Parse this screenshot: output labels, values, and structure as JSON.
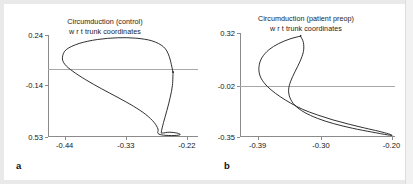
{
  "figure": {
    "background": "#ffffff",
    "axis_color": "#8b8b8b",
    "curve_color": "#1a1a1a",
    "zeroline_color": "#a8a8a8"
  },
  "panels": [
    {
      "letter": "a",
      "title_line1": "Circumduction (control)",
      "title_line2": "w r t trunk  coordinates",
      "yticks": [
        "0.24",
        "-0.14",
        "0.53"
      ],
      "xticks": [
        "-0.44",
        "-0.33",
        "-0.22"
      ]
    },
    {
      "letter": "b",
      "title_line1": "Circumduction (patient preop)",
      "title_line2": "w r t trunk  coordinates",
      "yticks": [
        "0.32",
        "-0.02",
        "-0.35"
      ],
      "xticks": [
        "-0.39",
        "-0.30",
        "-0.20"
      ]
    }
  ],
  "chart_data": [
    {
      "type": "line",
      "title": "Circumduction (control) w r t trunk coordinates",
      "subtitle": "w r t trunk  coordinates",
      "xlabel": "",
      "ylabel": "",
      "grid": false,
      "legend": "none",
      "xlim": [
        -0.47,
        -0.2
      ],
      "ylim": [
        -0.53,
        0.24
      ],
      "xticks": [
        -0.44,
        -0.33,
        -0.22
      ],
      "xticklabels": [
        "-0.44",
        "-0.33",
        "-0.22"
      ],
      "yticks": [
        0.24,
        -0.14,
        -0.53
      ],
      "yticklabels": [
        "0.24",
        "-0.14",
        "0.53"
      ],
      "reference_line_y": -0.02,
      "series": [
        {
          "name": "circumduction-path-control",
          "closed": true,
          "points": [
            [
              -0.245,
              -0.04
            ],
            [
              -0.252,
              0.08
            ],
            [
              -0.262,
              0.15
            ],
            [
              -0.283,
              0.196
            ],
            [
              -0.312,
              0.216
            ],
            [
              -0.345,
              0.219
            ],
            [
              -0.381,
              0.206
            ],
            [
              -0.414,
              0.176
            ],
            [
              -0.437,
              0.13
            ],
            [
              -0.444,
              0.072
            ],
            [
              -0.44,
              0.02
            ],
            [
              -0.425,
              -0.035
            ],
            [
              -0.402,
              -0.098
            ],
            [
              -0.374,
              -0.165
            ],
            [
              -0.344,
              -0.232
            ],
            [
              -0.316,
              -0.298
            ],
            [
              -0.294,
              -0.36
            ],
            [
              -0.279,
              -0.42
            ],
            [
              -0.272,
              -0.47
            ],
            [
              -0.272,
              -0.503
            ],
            [
              -0.262,
              -0.516
            ],
            [
              -0.243,
              -0.519
            ],
            [
              -0.232,
              -0.512
            ],
            [
              -0.238,
              -0.5
            ],
            [
              -0.252,
              -0.494
            ],
            [
              -0.264,
              -0.5
            ],
            [
              -0.266,
              -0.492
            ],
            [
              -0.262,
              -0.42
            ],
            [
              -0.256,
              -0.33
            ],
            [
              -0.25,
              -0.23
            ],
            [
              -0.246,
              -0.14
            ],
            [
              -0.245,
              -0.04
            ]
          ]
        }
      ]
    },
    {
      "type": "line",
      "title": "Circumduction (patient preop) w r t trunk coordinates",
      "subtitle": "w r t trunk  coordinates",
      "xlabel": "",
      "ylabel": "",
      "grid": false,
      "legend": "none",
      "xlim": [
        -0.415,
        -0.195
      ],
      "ylim": [
        -0.35,
        0.32
      ],
      "xticks": [
        -0.39,
        -0.3,
        -0.2
      ],
      "xticklabels": [
        "-0.39",
        "-0.30",
        "-0.20"
      ],
      "yticks": [
        0.32,
        -0.02,
        -0.35
      ],
      "yticklabels": [
        "0.32",
        "-0.02",
        "-0.35"
      ],
      "reference_line_y": -0.02,
      "series": [
        {
          "name": "circumduction-path-patient-preop",
          "closed": true,
          "points": [
            [
              -0.329,
              0.3
            ],
            [
              -0.344,
              0.282
            ],
            [
              -0.36,
              0.252
            ],
            [
              -0.374,
              0.212
            ],
            [
              -0.384,
              0.16
            ],
            [
              -0.388,
              0.105
            ],
            [
              -0.387,
              0.05
            ],
            [
              -0.381,
              0.0
            ],
            [
              -0.371,
              -0.046
            ],
            [
              -0.358,
              -0.09
            ],
            [
              -0.343,
              -0.132
            ],
            [
              -0.326,
              -0.172
            ],
            [
              -0.305,
              -0.208
            ],
            [
              -0.283,
              -0.24
            ],
            [
              -0.26,
              -0.268
            ],
            [
              -0.238,
              -0.292
            ],
            [
              -0.218,
              -0.313
            ],
            [
              -0.204,
              -0.33
            ],
            [
              -0.199,
              -0.34
            ],
            [
              -0.206,
              -0.336
            ],
            [
              -0.228,
              -0.318
            ],
            [
              -0.255,
              -0.294
            ],
            [
              -0.282,
              -0.264
            ],
            [
              -0.305,
              -0.23
            ],
            [
              -0.324,
              -0.19
            ],
            [
              -0.337,
              -0.146
            ],
            [
              -0.344,
              -0.098
            ],
            [
              -0.346,
              -0.046
            ],
            [
              -0.343,
              0.01
            ],
            [
              -0.337,
              0.07
            ],
            [
              -0.33,
              0.135
            ],
            [
              -0.325,
              0.2
            ],
            [
              -0.325,
              0.258
            ],
            [
              -0.329,
              0.3
            ]
          ]
        }
      ]
    }
  ]
}
